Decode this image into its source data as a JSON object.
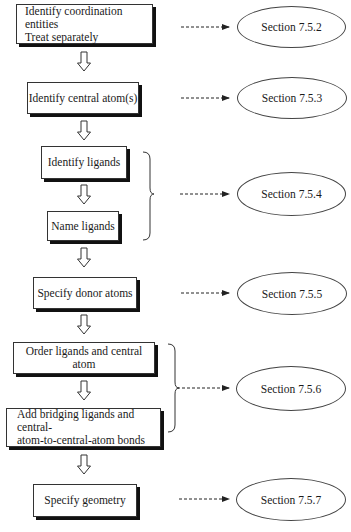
{
  "diagram": {
    "steps": [
      {
        "id": "step-1",
        "lines": [
          "Identify coordination entities",
          "Treat separately"
        ],
        "section": "Section 7.5.2"
      },
      {
        "id": "step-2",
        "lines": [
          "Identify central atom(s)"
        ],
        "section": "Section 7.5.3"
      },
      {
        "id": "step-3",
        "lines": [
          "Identify ligands"
        ]
      },
      {
        "id": "step-4",
        "lines": [
          "Name ligands"
        ]
      },
      {
        "id": "step-5",
        "lines": [
          "Specify donor atoms"
        ],
        "section": "Section 7.5.5"
      },
      {
        "id": "step-6",
        "lines": [
          "Order ligands and central atom"
        ]
      },
      {
        "id": "step-7",
        "lines": [
          "Add bridging ligands and central-",
          "atom-to-central-atom bonds"
        ]
      },
      {
        "id": "step-8",
        "lines": [
          "Specify geometry"
        ],
        "section": "Section 7.5.7"
      }
    ],
    "grouped_sections": [
      {
        "steps": [
          "step-3",
          "step-4"
        ],
        "section": "Section 7.5.4"
      },
      {
        "steps": [
          "step-6",
          "step-7"
        ],
        "section": "Section 7.5.6"
      }
    ],
    "sections": {
      "s752": "Section 7.5.2",
      "s753": "Section 7.5.3",
      "s754": "Section 7.5.4",
      "s755": "Section 7.5.5",
      "s756": "Section 7.5.6",
      "s757": "Section 7.5.7"
    },
    "colors": {
      "line": "#333333",
      "shadow": "#111111",
      "background": "#ffffff"
    }
  }
}
